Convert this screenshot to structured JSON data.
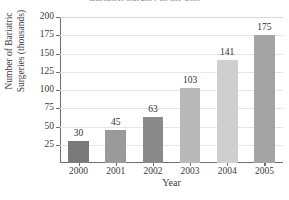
{
  "chart_data": {
    "type": "bar",
    "title": "Bariatric Surgery in the U.S.",
    "xlabel": "Year",
    "ylabel": "Number of Bariatric Surgeries (thousands)",
    "ylabel_line1": "Number of Bariatric",
    "ylabel_line2": "Surgeries (thousands)",
    "categories": [
      "2000",
      "2001",
      "2002",
      "2003",
      "2004",
      "2005"
    ],
    "values": [
      30,
      45,
      63,
      103,
      141,
      175
    ],
    "value_labels": [
      "30",
      "45",
      "63",
      "103",
      "141",
      "175"
    ],
    "ylim": [
      0,
      200
    ],
    "ytick_labels": [
      "200",
      "175",
      "150",
      "125",
      "100",
      "75",
      "50",
      "25"
    ],
    "ytick_values": [
      200,
      175,
      150,
      125,
      100,
      75,
      50,
      25
    ],
    "grid": true,
    "legend": "none",
    "bar_colors": [
      "#7b7b7b",
      "#9a9a9a",
      "#8a8a8a",
      "#b9b9b9",
      "#cfcfcf",
      "#a4a4a4"
    ],
    "axis_color": "#6e6e6e",
    "grid_color": "#e6e6e6",
    "background": "#ffffff"
  }
}
